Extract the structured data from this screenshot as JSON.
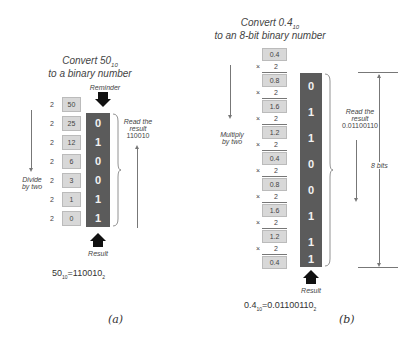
{
  "panel_a": {
    "title_line1": "Convert 50",
    "title_sub": "10",
    "title_line2": "to a binary number",
    "reminder_label": "Reminder",
    "divisor": "2",
    "quotients": [
      "50",
      "25",
      "12",
      "6",
      "3",
      "1",
      "0"
    ],
    "bits": [
      "0",
      "1",
      "0",
      "0",
      "1",
      "1"
    ],
    "side_label_line1": "Divide",
    "side_label_line2": "by two",
    "read_label_line1": "Read the",
    "read_label_line2": "result",
    "read_value": "110010",
    "result_label": "Result",
    "equation_lhs": "50",
    "equation_lhs_sub": "10",
    "equation_rhs": "=110010",
    "equation_rhs_sub": "2",
    "caption": "(a)"
  },
  "panel_b": {
    "title_line1": "Convert 0.4",
    "title_sub": "10",
    "title_line2": "to an 8-bit binary number",
    "multiplier": "2",
    "times": "×",
    "values": [
      "0.4",
      "0.8",
      "1.6",
      "1.2",
      "0.4",
      "0.8",
      "1.6",
      "1.2",
      "0.4"
    ],
    "bits": [
      "0",
      "1",
      "1",
      "0",
      "0",
      "1",
      "1",
      "1"
    ],
    "side_label_line1": "Multiply",
    "side_label_line2": "by two",
    "read_label_line1": "Read the",
    "read_label_line2": "result",
    "read_value": "0.01100110",
    "bits_label": "8 bits",
    "result_label": "Result",
    "equation_lhs": "0.4",
    "equation_lhs_sub": "10",
    "equation_rhs": "=0.01100110",
    "equation_rhs_sub": "2",
    "caption": "(b)"
  }
}
